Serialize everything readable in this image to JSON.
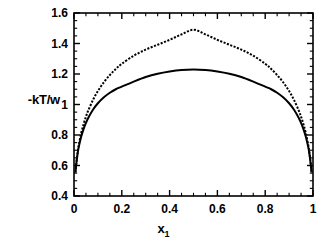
{
  "chart_data": {
    "type": "line",
    "title": "",
    "xlabel": "x",
    "xlabel_sub": "1",
    "ylabel": "-kT/w",
    "xlim": [
      0,
      1
    ],
    "ylim": [
      0.4,
      1.6
    ],
    "xticks": [
      "0",
      "0.2",
      "0.4",
      "0.6",
      "0.8",
      "1"
    ],
    "xtick_values": [
      0,
      0.2,
      0.4,
      0.6,
      0.8,
      1
    ],
    "yticks": [
      "0.4",
      "0.6",
      "0.8",
      "1",
      "1.2",
      "1.4",
      "1.6"
    ],
    "ytick_values": [
      0.4,
      0.6,
      0.8,
      1.0,
      1.2,
      1.4,
      1.6
    ],
    "grid": false,
    "legend": false,
    "minor_ticks_x": 20,
    "minor_ticks_y": 24,
    "series": [
      {
        "name": "spinodal",
        "style": "solid",
        "color": "#000000",
        "linewidth": 2,
        "x": [
          0.006,
          0.01,
          0.015,
          0.02,
          0.03,
          0.04,
          0.05,
          0.06,
          0.08,
          0.1,
          0.125,
          0.15,
          0.175,
          0.2,
          0.25,
          0.3,
          0.35,
          0.4,
          0.45,
          0.5,
          0.55,
          0.6,
          0.65,
          0.7,
          0.75,
          0.8,
          0.825,
          0.85,
          0.875,
          0.9,
          0.92,
          0.94,
          0.95,
          0.96,
          0.97,
          0.98,
          0.985,
          0.99,
          0.994
        ],
        "y": [
          0.554,
          0.615,
          0.676,
          0.722,
          0.789,
          0.839,
          0.879,
          0.913,
          0.967,
          1.008,
          1.047,
          1.077,
          1.1,
          1.117,
          1.15,
          1.18,
          1.202,
          1.217,
          1.227,
          1.23,
          1.227,
          1.217,
          1.202,
          1.18,
          1.15,
          1.117,
          1.1,
          1.077,
          1.047,
          1.008,
          0.967,
          0.913,
          0.879,
          0.839,
          0.789,
          0.722,
          0.676,
          0.615,
          0.554
        ]
      },
      {
        "name": "binodal",
        "style": "dotted",
        "color": "#000000",
        "linewidth": 2,
        "x": [
          0.006,
          0.01,
          0.015,
          0.02,
          0.03,
          0.04,
          0.05,
          0.06,
          0.08,
          0.1,
          0.125,
          0.15,
          0.175,
          0.2,
          0.25,
          0.3,
          0.35,
          0.4,
          0.45,
          0.5,
          0.55,
          0.6,
          0.65,
          0.7,
          0.75,
          0.8,
          0.825,
          0.85,
          0.875,
          0.9,
          0.92,
          0.94,
          0.95,
          0.96,
          0.97,
          0.98,
          0.985,
          0.99,
          0.994
        ],
        "y": [
          0.555,
          0.62,
          0.685,
          0.735,
          0.812,
          0.871,
          0.92,
          0.962,
          1.032,
          1.088,
          1.146,
          1.193,
          1.233,
          1.267,
          1.32,
          1.36,
          1.392,
          1.424,
          1.46,
          1.49,
          1.46,
          1.424,
          1.392,
          1.36,
          1.32,
          1.267,
          1.233,
          1.193,
          1.146,
          1.088,
          1.032,
          0.962,
          0.92,
          0.871,
          0.812,
          0.735,
          0.685,
          0.62,
          0.555
        ]
      }
    ]
  },
  "axes": {
    "plot_left_px": 74,
    "plot_right_px": 313,
    "plot_top_px": 13,
    "plot_bottom_px": 196,
    "frame_color": "#000000"
  }
}
